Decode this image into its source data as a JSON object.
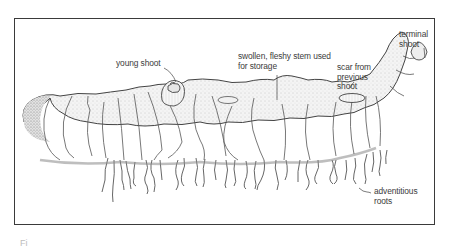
{
  "figure": {
    "labels": {
      "young_shoot": "young shoot",
      "swollen_stem": "swollen, fleshy stem used\nfor storage",
      "scar": "scar from\nprevious\nshoot",
      "terminal_shoot": "terminal\nshoot",
      "adventitious_roots": "adventitious\nroots"
    },
    "caption_partial": "Fi"
  }
}
